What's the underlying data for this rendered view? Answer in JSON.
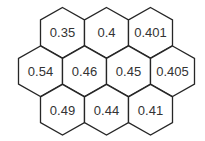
{
  "diagram": {
    "type": "hexagonal-grid",
    "rows": [
      {
        "offset": "inner",
        "cells": [
          {
            "label": "0.35"
          },
          {
            "label": "0.4"
          },
          {
            "label": "0.401"
          }
        ]
      },
      {
        "offset": "outer",
        "cells": [
          {
            "label": "0.54"
          },
          {
            "label": "0.46"
          },
          {
            "label": "0.45"
          },
          {
            "label": "0.405"
          }
        ]
      },
      {
        "offset": "inner",
        "cells": [
          {
            "label": "0.49"
          },
          {
            "label": "0.44"
          },
          {
            "label": "0.41"
          }
        ]
      }
    ],
    "colors": {
      "stroke": "#262626",
      "fill": "#ffffff",
      "text": "#333333"
    }
  }
}
